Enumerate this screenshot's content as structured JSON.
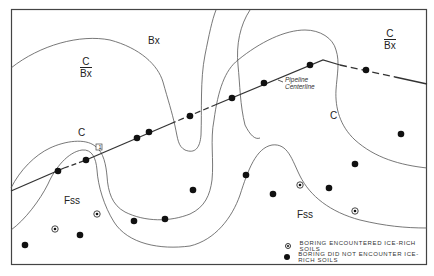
{
  "diagram": {
    "type": "soil boring site plan",
    "region_labels": [
      {
        "id": "bx-top",
        "text": "Bx",
        "x": 148,
        "y": 36
      },
      {
        "id": "c-left",
        "text": "C",
        "x": 78,
        "y": 128
      },
      {
        "id": "c-right",
        "text": "C",
        "x": 330,
        "y": 111
      },
      {
        "id": "fss-left",
        "text": "Fss",
        "x": 64,
        "y": 196
      },
      {
        "id": "fss-right",
        "text": "Fss",
        "x": 297,
        "y": 210
      }
    ],
    "fraction_labels": [
      {
        "id": "c-over-bx-left",
        "numerator": "C",
        "denominator": "Bx",
        "x": 80,
        "y": 56
      },
      {
        "id": "c-over-bx-right",
        "numerator": "C",
        "denominator": "Bx",
        "x": 384,
        "y": 28
      }
    ],
    "pipeline": {
      "label_line1": "Pipeline",
      "label_line2": "Centerline",
      "label_x": 284,
      "label_y": 80,
      "marker_label": "1"
    },
    "legend": {
      "items": [
        {
          "symbol": "ringed-dot",
          "text": "BORING ENCOUNTERED ICE-RICH SOILS"
        },
        {
          "symbol": "solid-dot",
          "text": "BORING DID NOT ENCOUNTER ICE-RICH SOILS"
        }
      ]
    },
    "borings_no_ice": [
      [
        58,
        171
      ],
      [
        86,
        160
      ],
      [
        137,
        138
      ],
      [
        149,
        132
      ],
      [
        190,
        116
      ],
      [
        232,
        98
      ],
      [
        264,
        83
      ],
      [
        310,
        65
      ],
      [
        366,
        70
      ],
      [
        193,
        190
      ],
      [
        80,
        235
      ],
      [
        25,
        245
      ],
      [
        134,
        221
      ],
      [
        165,
        219
      ],
      [
        246,
        175
      ],
      [
        273,
        194
      ],
      [
        329,
        188
      ],
      [
        355,
        164
      ],
      [
        401,
        134
      ]
    ],
    "borings_ice_rich": [
      [
        97,
        214
      ],
      [
        55,
        229
      ],
      [
        300,
        185
      ],
      [
        355,
        211
      ]
    ],
    "colors": {
      "line": "#333333",
      "contour": "#555555",
      "dot": "#111111",
      "background": "#ffffff"
    }
  }
}
